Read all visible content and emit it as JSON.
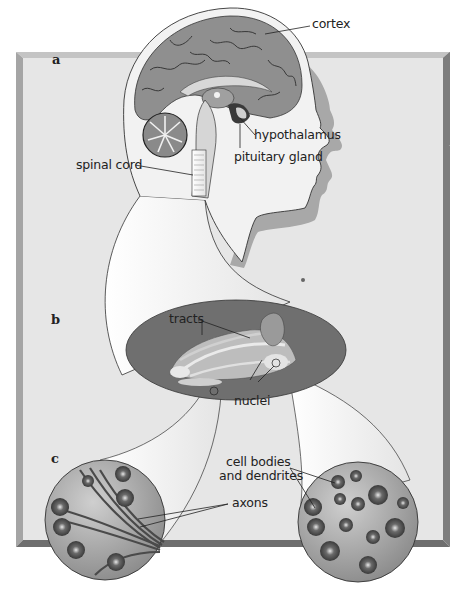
{
  "figure": {
    "panels": [
      {
        "id": "a",
        "label": "a"
      },
      {
        "id": "b",
        "label": "b"
      },
      {
        "id": "c",
        "label": "c"
      }
    ],
    "labels": {
      "cortex": "cortex",
      "hypothalamus": "hypothalamus",
      "pituitary_gland": "pituitary gland",
      "spinal_cord": "spinal cord",
      "tracts": "tracts",
      "nuclei": "nuclei",
      "cell_bodies_line1": "cell bodies",
      "cell_bodies_line2": "and dendrites",
      "axons": "axons"
    },
    "colors": {
      "frame_face": "#e6e6e6",
      "frame_top_edge": "#c4c4c4",
      "frame_right_edge": "#7d7d7d",
      "frame_bottom_edge": "#6e6e6e",
      "frame_left_edge": "#a5a5a5",
      "brain_gray": "#8f8f8f",
      "head_fill": "#f2f2f2",
      "head_shadow": "#a8a8a8",
      "ellipse_fill": "#6f6f6f",
      "circle_fill": "#a6a6a6",
      "outline": "#333333"
    }
  }
}
